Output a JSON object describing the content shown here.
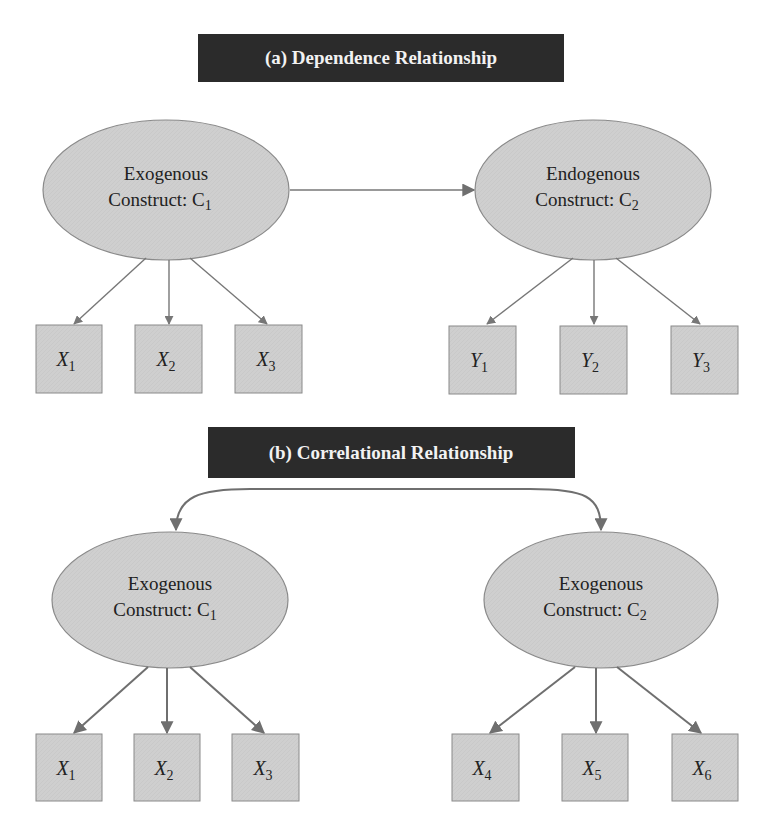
{
  "colors": {
    "title_bg": "#2b2b2b",
    "title_text": "#f2f2f2",
    "node_fill": "#cfcfcf",
    "node_stroke": "#8a8a8a",
    "arrow": "#777777",
    "text": "#222222"
  },
  "panel_a": {
    "title": "(a) Dependence Relationship",
    "left_construct": {
      "line1": "Exogenous",
      "line2": "Construct: C",
      "sub": "1"
    },
    "right_construct": {
      "line1": "Endogenous",
      "line2": "Construct: C",
      "sub": "2"
    },
    "relationship": "directed arrow C1 → C2",
    "left_indicators": [
      {
        "var": "X",
        "sub": "1"
      },
      {
        "var": "X",
        "sub": "2"
      },
      {
        "var": "X",
        "sub": "3"
      }
    ],
    "right_indicators": [
      {
        "var": "Y",
        "sub": "1"
      },
      {
        "var": "Y",
        "sub": "2"
      },
      {
        "var": "Y",
        "sub": "3"
      }
    ]
  },
  "panel_b": {
    "title": "(b) Correlational Relationship",
    "left_construct": {
      "line1": "Exogenous",
      "line2": "Construct: C",
      "sub": "1"
    },
    "right_construct": {
      "line1": "Exogenous",
      "line2": "Construct: C",
      "sub": "2"
    },
    "relationship": "curved double-headed arrow C1 ↔ C2",
    "left_indicators": [
      {
        "var": "X",
        "sub": "1"
      },
      {
        "var": "X",
        "sub": "2"
      },
      {
        "var": "X",
        "sub": "3"
      }
    ],
    "right_indicators": [
      {
        "var": "X",
        "sub": "4"
      },
      {
        "var": "X",
        "sub": "5"
      },
      {
        "var": "X",
        "sub": "6"
      }
    ]
  }
}
